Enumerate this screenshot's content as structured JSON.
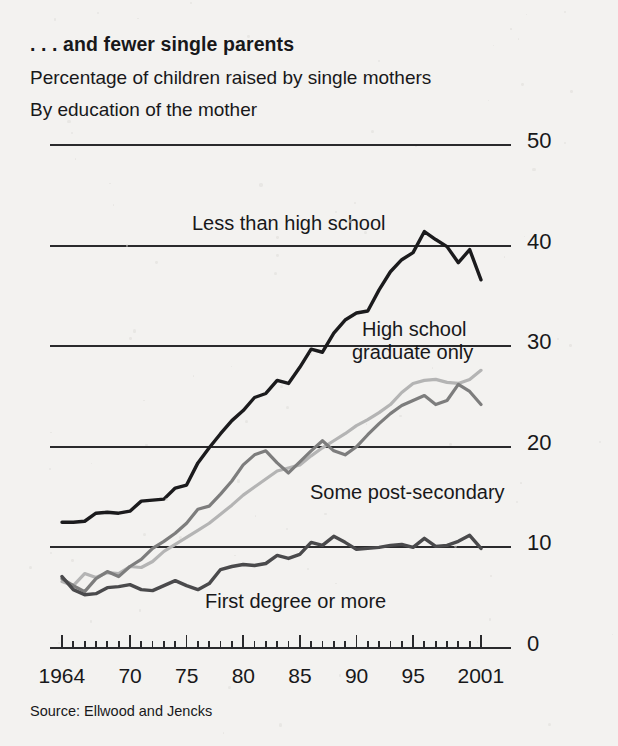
{
  "header": {
    "title": ". . . and fewer single parents",
    "subtitle1": "Percentage of children raised by single mothers",
    "subtitle2": "By education of the mother"
  },
  "source": "Source: Ellwood and Jencks",
  "colors": {
    "ink": "#18181a",
    "series_dark": "#1b1b1d",
    "series_midgray": "#7d7d7d",
    "series_lightgray": "#b4b4b4",
    "gridline": "#2a2a2c",
    "background": "#f3f2f0"
  },
  "series_labels": [
    {
      "name": "less-than-high-school",
      "text": "Less than high school",
      "x": 192,
      "y": 212
    },
    {
      "name": "high-school-graduate-only-line1",
      "text": "High school",
      "x": 362,
      "y": 318
    },
    {
      "name": "high-school-graduate-only-line2",
      "text": "graduate only",
      "x": 352,
      "y": 341
    },
    {
      "name": "some-post-secondary",
      "text": "Some post-secondary",
      "x": 310,
      "y": 481
    },
    {
      "name": "first-degree-or-more",
      "text": "First degree or more",
      "x": 205,
      "y": 590
    }
  ],
  "chart_data": {
    "type": "line",
    "title": ". . . and fewer single parents",
    "subtitle": "Percentage of children raised by single mothers / By education of the mother",
    "xlabel": "",
    "ylabel": "",
    "xlim": [
      1964,
      2001
    ],
    "ylim": [
      0,
      50
    ],
    "yticks": [
      0,
      10,
      20,
      30,
      40,
      50
    ],
    "ytick_labels": [
      "0",
      "10",
      "20",
      "30",
      "40",
      "50"
    ],
    "xticks": [
      1964,
      1970,
      1975,
      1980,
      1985,
      1990,
      1995,
      2001
    ],
    "xtick_labels": [
      "1964",
      "70",
      "75",
      "80",
      "85",
      "90",
      "95",
      "2001"
    ],
    "grid": "horizontal",
    "legend": "inline-annotations",
    "x": [
      1964,
      1965,
      1966,
      1967,
      1968,
      1969,
      1970,
      1971,
      1972,
      1973,
      1974,
      1975,
      1976,
      1977,
      1978,
      1979,
      1980,
      1981,
      1982,
      1983,
      1984,
      1985,
      1986,
      1987,
      1988,
      1989,
      1990,
      1991,
      1992,
      1993,
      1994,
      1995,
      1996,
      1997,
      1998,
      1999,
      2000,
      2001
    ],
    "series": [
      {
        "name": "Less than high school",
        "color": "#1b1b1d",
        "values": [
          12.5,
          12.5,
          12.6,
          13.4,
          13.5,
          13.4,
          13.6,
          14.6,
          14.7,
          14.8,
          15.9,
          16.2,
          18.4,
          19.9,
          21.3,
          22.6,
          23.6,
          24.9,
          25.3,
          26.6,
          26.3,
          27.9,
          29.7,
          29.4,
          31.3,
          32.6,
          33.3,
          33.5,
          35.6,
          37.4,
          38.6,
          39.3,
          41.4,
          40.6,
          39.9,
          38.3,
          39.6,
          36.6
        ]
      },
      {
        "name": "High school graduate only",
        "color": "#b4b4b4",
        "values": [
          6.6,
          6.2,
          7.4,
          7.0,
          7.5,
          7.4,
          8.1,
          8.0,
          8.6,
          9.6,
          10.3,
          11.0,
          11.7,
          12.4,
          13.3,
          14.2,
          15.2,
          16.0,
          16.8,
          17.6,
          17.9,
          18.2,
          19.1,
          19.9,
          20.6,
          21.3,
          22.1,
          22.7,
          23.4,
          24.2,
          25.4,
          26.3,
          26.6,
          26.7,
          26.4,
          26.3,
          26.7,
          27.6
        ]
      },
      {
        "name": "Some post-secondary",
        "color": "#7d7d7d",
        "values": [
          6.9,
          6.2,
          5.6,
          6.9,
          7.6,
          7.1,
          8.1,
          8.8,
          9.9,
          10.6,
          11.4,
          12.4,
          13.8,
          14.1,
          15.3,
          16.6,
          18.2,
          19.2,
          19.6,
          18.4,
          17.4,
          18.5,
          19.6,
          20.6,
          19.6,
          19.2,
          20.0,
          21.2,
          22.3,
          23.3,
          24.1,
          24.6,
          25.1,
          24.2,
          24.6,
          26.2,
          25.5,
          24.2
        ]
      },
      {
        "name": "First degree or more",
        "color": "#4a4a4c",
        "values": [
          7.1,
          5.8,
          5.3,
          5.4,
          6.0,
          6.1,
          6.3,
          5.8,
          5.7,
          6.2,
          6.7,
          6.2,
          5.8,
          6.4,
          7.8,
          8.1,
          8.3,
          8.2,
          8.4,
          9.2,
          8.9,
          9.3,
          10.5,
          10.2,
          11.1,
          10.5,
          9.8,
          9.9,
          10.0,
          10.2,
          10.3,
          10.0,
          10.9,
          10.1,
          10.2,
          10.6,
          11.2,
          9.9
        ]
      }
    ]
  }
}
